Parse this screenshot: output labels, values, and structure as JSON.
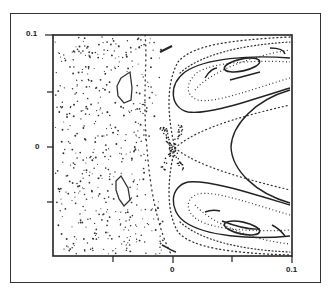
{
  "chart_data": {
    "type": "scatter",
    "title": "",
    "xlabel": "",
    "ylabel": "",
    "xlim": [
      -0.1,
      0.1
    ],
    "ylim": [
      -0.1,
      0.1
    ],
    "x_ticks": [
      -0.1,
      -0.05,
      0,
      0.05,
      0.1
    ],
    "y_ticks": [
      -0.1,
      -0.05,
      0,
      0.05,
      0.1
    ],
    "x_tick_labels": [
      "",
      "",
      "0",
      "",
      "0.1"
    ],
    "y_tick_labels": [
      "",
      "",
      "0",
      "",
      "0.1"
    ],
    "grid": false,
    "legend": null,
    "features": {
      "x_point": [
        0.0,
        0.0
      ],
      "parabolic_vertex": [
        0.05,
        0.0
      ],
      "upper_island_center": [
        0.068,
        0.072
      ],
      "lower_island_center": [
        0.068,
        -0.072
      ],
      "chaotic_islands": [
        [
          -0.05,
          0.03
        ],
        [
          -0.05,
          -0.03
        ]
      ]
    }
  },
  "axes": {
    "y_top_label": "0.1",
    "y_zero_label": "0",
    "x_zero_label": "0",
    "x_right_label": "0.1"
  }
}
